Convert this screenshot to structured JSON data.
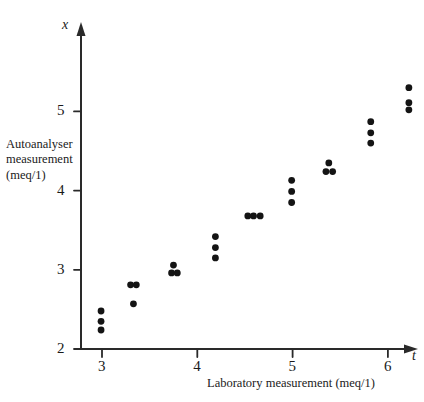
{
  "chart_data": {
    "type": "scatter",
    "title": "",
    "xlabel": "Laboratory measurement (meq/1)",
    "ylabel": "Autoanalyser measurement (meq/1)",
    "ylabel_lines": [
      "Autoanalyser",
      "measurement",
      "(meq/1)"
    ],
    "x_variable_symbol": "t",
    "y_variable_symbol": "x",
    "xlim": [
      2.7,
      6.2
    ],
    "ylim": [
      2.0,
      5.65
    ],
    "xticks": [
      3,
      4,
      5,
      6
    ],
    "yticks": [
      2,
      3,
      4,
      5
    ],
    "xticklabels": [
      "3",
      "4",
      "5",
      "6"
    ],
    "yticklabels": [
      "2",
      "3",
      "4",
      "5"
    ],
    "grid": false,
    "legend": false,
    "marker": "filled-circle",
    "marker_color": "#141414",
    "points": [
      {
        "x": 2.99,
        "y": 2.48
      },
      {
        "x": 2.99,
        "y": 2.35
      },
      {
        "x": 2.99,
        "y": 2.24
      },
      {
        "x": 3.3,
        "y": 2.81
      },
      {
        "x": 3.36,
        "y": 2.81
      },
      {
        "x": 3.33,
        "y": 2.57
      },
      {
        "x": 3.75,
        "y": 3.06
      },
      {
        "x": 3.73,
        "y": 2.96
      },
      {
        "x": 3.79,
        "y": 2.96
      },
      {
        "x": 4.19,
        "y": 3.42
      },
      {
        "x": 4.19,
        "y": 3.28
      },
      {
        "x": 4.19,
        "y": 3.15
      },
      {
        "x": 4.53,
        "y": 3.68
      },
      {
        "x": 4.59,
        "y": 3.68
      },
      {
        "x": 4.66,
        "y": 3.68
      },
      {
        "x": 4.99,
        "y": 4.13
      },
      {
        "x": 4.99,
        "y": 3.99
      },
      {
        "x": 4.99,
        "y": 3.85
      },
      {
        "x": 5.38,
        "y": 4.35
      },
      {
        "x": 5.35,
        "y": 4.24
      },
      {
        "x": 5.42,
        "y": 4.24
      },
      {
        "x": 5.82,
        "y": 4.87
      },
      {
        "x": 5.82,
        "y": 4.73
      },
      {
        "x": 5.82,
        "y": 4.6
      },
      {
        "x": 6.22,
        "y": 5.3
      },
      {
        "x": 6.22,
        "y": 5.11
      },
      {
        "x": 6.22,
        "y": 5.02
      }
    ]
  },
  "axes": {
    "x_symbol": "t",
    "y_symbol": "x"
  }
}
